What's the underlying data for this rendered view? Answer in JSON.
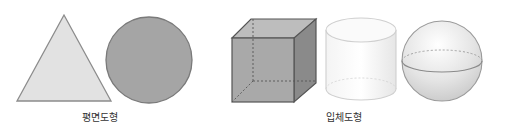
{
  "groups": [
    {
      "label": "평면도형",
      "shapes": [
        "triangle",
        "circle"
      ]
    },
    {
      "label": "입체도형",
      "shapes": [
        "cube",
        "cylinder",
        "sphere"
      ]
    }
  ],
  "colors": {
    "triangle_fill": "#e2e2e2",
    "circle_fill": "#a5a5a5",
    "cube_front": "#a9a9a9",
    "cube_side": "#8a8a8a",
    "cube_top": "#bdbdbd",
    "outline": "#7a7a7a",
    "label_text": "#333333"
  }
}
